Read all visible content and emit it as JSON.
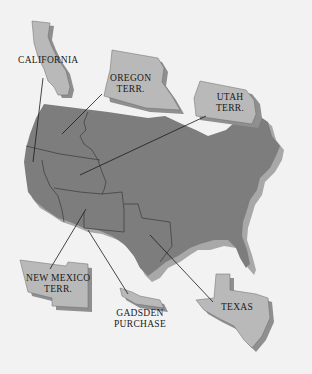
{
  "map": {
    "title": "",
    "colors": {
      "background": "#f2f2f2",
      "us_territory": "#7d7d7d",
      "us_shadow": "#a8a8a8",
      "acquisition_fill": "#b9b9b9",
      "acquisition_shadow": "#8f8f8f",
      "leader_line": "#1a1a1a"
    },
    "labels": [
      {
        "id": "california",
        "text": "CALIFORNIA"
      },
      {
        "id": "oregon",
        "text": "OREGON\nTERR."
      },
      {
        "id": "utah",
        "text": "UTAH\nTERR."
      },
      {
        "id": "new-mexico",
        "text": "NEW MEXICO\nTERR."
      },
      {
        "id": "gadsden",
        "text": "GADSDEN\nPURCHASE"
      },
      {
        "id": "texas",
        "text": "TEXAS"
      }
    ]
  }
}
